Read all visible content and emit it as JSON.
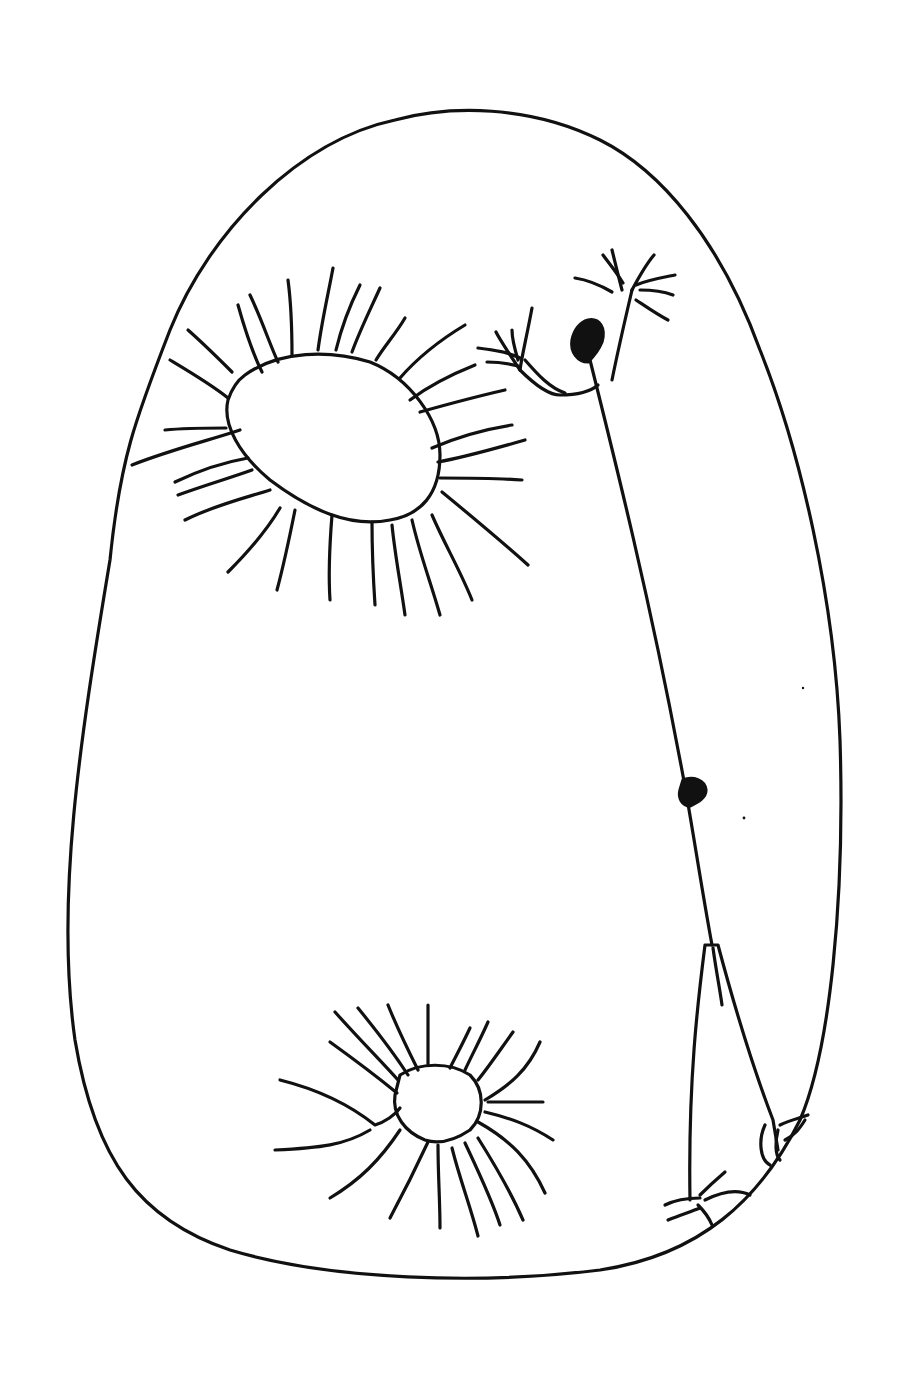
{
  "figure": {
    "description": "Black ink line drawing on white: egg-shaped body outline containing two ciliated oval cells and a stalk with a dark terminal blob, a mid-stalk knot, and a basal cone",
    "colors": {
      "ink": "#111111",
      "background": "#ffffff"
    },
    "elements": [
      {
        "name": "body-outline",
        "shape": "egg"
      },
      {
        "name": "upper-cell",
        "shape": "oval with radiating cilia"
      },
      {
        "name": "lower-cell",
        "shape": "small oval with radiating cilia"
      },
      {
        "name": "stalk",
        "shape": "thin line from dark blob to basal cone"
      },
      {
        "name": "terminal-blob",
        "shape": "filled teardrop"
      },
      {
        "name": "mid-knot",
        "shape": "filled small blob"
      },
      {
        "name": "basal-cone",
        "shape": "elongated triangle with root tufts"
      },
      {
        "name": "branch-tufts",
        "shape": "forked bristle clusters"
      }
    ]
  }
}
